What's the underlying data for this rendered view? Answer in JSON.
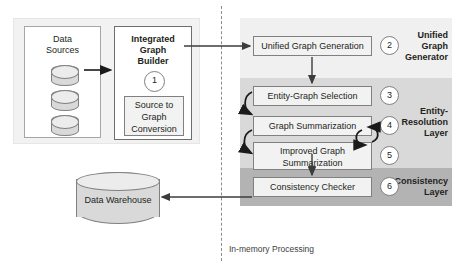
{
  "diagram": {
    "divider_label": "In-memory Processing",
    "left_panel": {
      "data_sources": {
        "label_line1": "Data",
        "label_line2": "Sources",
        "cylinder_count": 3
      },
      "integrated_graph_builder": {
        "label_line1": "Integrated",
        "label_line2": "Graph",
        "label_line3": "Builder",
        "step": "1",
        "sub_box": {
          "line1": "Source to",
          "line2": "Graph",
          "line3": "Conversion"
        }
      }
    },
    "data_warehouse": {
      "label": "Data Warehouse"
    },
    "bands": [
      {
        "name": "unified-graph-generator",
        "label_line1": "Unified",
        "label_line2": "Graph",
        "label_line3": "Generator",
        "color": "#f0f0f0"
      },
      {
        "name": "entity-resolution-layer",
        "label_line1": "Entity-",
        "label_line2": "Resolution",
        "label_line3": "Layer",
        "color": "#d9d9d9"
      },
      {
        "name": "consistency-layer",
        "label_line1": "Consistency",
        "label_line2": "Layer",
        "color": "#b3b3b3"
      }
    ],
    "processes": [
      {
        "name": "unified-graph-generation",
        "label": "Unified Graph Generation",
        "step": "2"
      },
      {
        "name": "entity-graph-selection",
        "label": "Entity-Graph Selection",
        "step": "3"
      },
      {
        "name": "graph-summarization",
        "label": "Graph Summarization",
        "step": "4"
      },
      {
        "name": "improved-graph-summarization",
        "label_line1": "Improved Graph",
        "label_line2": "Summarization",
        "step": "5"
      },
      {
        "name": "consistency-checker",
        "label": "Consistency Checker",
        "step": "6"
      }
    ],
    "colors": {
      "band_light": "#f0f0f0",
      "band_mid": "#d9d9d9",
      "band_dark": "#b3b3b3",
      "box_fill": "#f2f2f2",
      "stroke": "#808080",
      "text": "#231f20",
      "panel_fill": "#f2f2f2",
      "cylinder_fill": "#d9d9d9"
    }
  }
}
